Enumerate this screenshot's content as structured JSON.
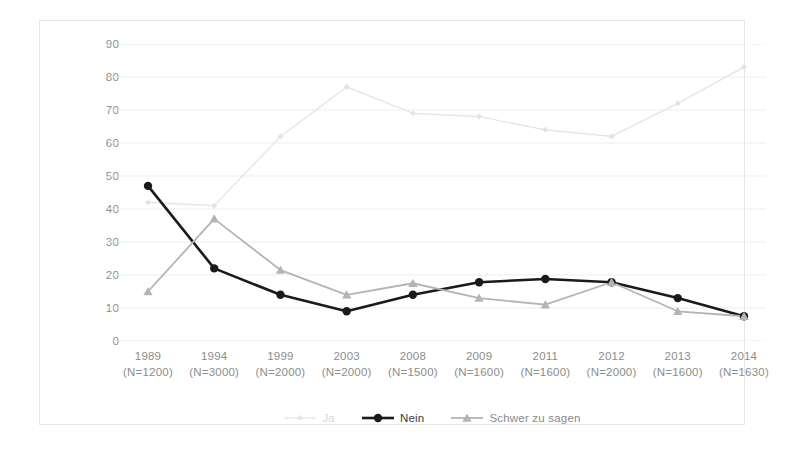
{
  "chart_data": {
    "type": "line",
    "title": "",
    "subtitle": "",
    "xlabel": "",
    "ylabel": "",
    "ylim": [
      0,
      90
    ],
    "ytick_step": 10,
    "yticks": [
      90,
      80,
      70,
      60,
      50,
      40,
      30,
      20,
      10,
      0
    ],
    "grid": true,
    "grid_axis": "y",
    "legend_position": "bottom",
    "categories": [
      "1989",
      "1994",
      "1999",
      "2003",
      "2008",
      "2009",
      "2011",
      "2012",
      "2013",
      "2014"
    ],
    "category_sublabels": [
      "(N=1200)",
      "(N=3000)",
      "(N=2000)",
      "(N=2000)",
      "(N=1500)",
      "(N=1600)",
      "(N=1600)",
      "(N=2000)",
      "(N=1600)",
      "(N=1630)"
    ],
    "series": [
      {
        "name": "Ja",
        "values": [
          42,
          41,
          62,
          77,
          69,
          68,
          64,
          62,
          72,
          83
        ],
        "color": "#e3e3e3",
        "marker": "diamond",
        "line_width": 1.2
      },
      {
        "name": "Nein",
        "values": [
          47,
          22,
          14,
          9,
          14,
          17.8,
          18.8,
          17.8,
          13,
          7.5
        ],
        "color": "#1a1a1a",
        "marker": "circle",
        "line_width": 2.6
      },
      {
        "name": "Schwer zu sagen",
        "values": [
          15,
          37,
          21.5,
          14,
          17.5,
          13,
          11,
          17.8,
          9,
          7.5
        ],
        "color": "#b4b4b4",
        "marker": "triangle",
        "line_width": 1.8
      }
    ]
  },
  "legend": {
    "items": [
      {
        "label": "Ja",
        "key": "ja"
      },
      {
        "label": "Nein",
        "key": "nein"
      },
      {
        "label": "Schwer zu sagen",
        "key": "schwer"
      }
    ]
  },
  "colors": {
    "ja": "#e3e3e3",
    "nein": "#1a1a1a",
    "schwer": "#b4b4b4",
    "grid": "#ededed",
    "axis_text": "#8c8c8c",
    "frame": "#e6e6e6"
  }
}
